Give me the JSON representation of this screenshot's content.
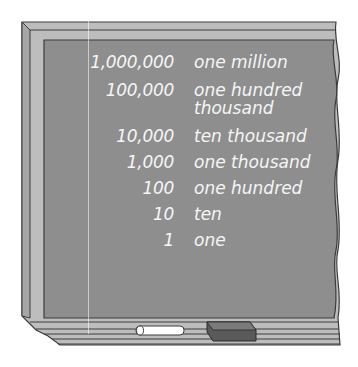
{
  "colors": {
    "board": "#8e8e8e",
    "frame_light": "#bdbdbd",
    "frame_mid": "#a6a6a6",
    "frame_dark": "#3c3c3c",
    "chalk_text": "#f6f6f6",
    "chalk_stick": "#ffffff",
    "eraser": "#5a5a5a"
  },
  "chalkboard": {
    "rows": [
      {
        "number": "1,000,000",
        "word": "one million"
      },
      {
        "number": "100,000",
        "word": "one hundred",
        "word_line2": "thousand"
      },
      {
        "number": "10,000",
        "word": "ten thousand"
      },
      {
        "number": "1,000",
        "word": "one thousand"
      },
      {
        "number": "100",
        "word": "one hundred"
      },
      {
        "number": "10",
        "word": "ten"
      },
      {
        "number": "1",
        "word": "one"
      }
    ]
  },
  "tray": {
    "items": [
      "chalk-stick",
      "eraser"
    ]
  }
}
